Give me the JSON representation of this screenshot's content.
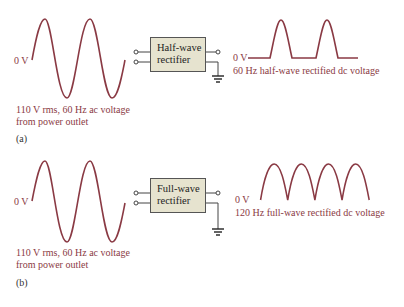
{
  "colors": {
    "waveform": "#8a3a44",
    "label_text": "#8a3a44",
    "box_fill": "#e6e3cf",
    "box_border": "#555555",
    "wire": "#444444"
  },
  "panel_a": {
    "input_zero_label": "0 V",
    "input_caption_line1": "110 V rms, 60 Hz ac voltage",
    "input_caption_line2": "from power outlet",
    "block_line1": "Half-wave",
    "block_line2": "rectifier",
    "output_zero_label": "0 V",
    "output_caption": "60 Hz half-wave rectified dc voltage",
    "panel_label": "(a)"
  },
  "panel_b": {
    "input_zero_label": "0 V",
    "input_caption_line1": "110 V rms, 60 Hz ac voltage",
    "input_caption_line2": "from power outlet",
    "block_line1": "Full-wave",
    "block_line2": "rectifier",
    "output_zero_label": "0 V",
    "output_caption": "120 Hz full-wave rectified dc voltage",
    "panel_label": "(b)"
  }
}
